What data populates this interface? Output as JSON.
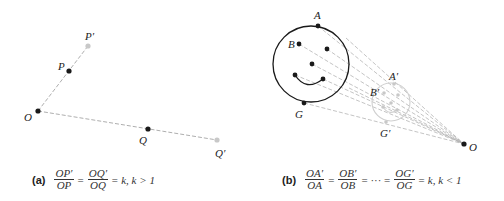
{
  "panel_a": {
    "labels": {
      "O": "O",
      "P": "P",
      "P_prime": "P′",
      "Q": "Q",
      "Q_prime": "Q′"
    },
    "caption": {
      "tag": "(a)",
      "frac1": {
        "num": "OP′",
        "den": "OP"
      },
      "eq1": "=",
      "frac2": {
        "num": "OQ′",
        "den": "OQ"
      },
      "tail": "= k, k > 1"
    }
  },
  "panel_b": {
    "labels": {
      "A": "A",
      "B": "B",
      "G": "G",
      "A_prime": "A′",
      "B_prime": "B′",
      "G_prime": "G′",
      "O": "O"
    },
    "caption": {
      "tag": "(b)",
      "frac1": {
        "num": "OA′",
        "den": "OA"
      },
      "eq1": "=",
      "frac2": {
        "num": "OB′",
        "den": "OB"
      },
      "eq2": "= ··· =",
      "frac3": {
        "num": "OG′",
        "den": "OG"
      },
      "tail": "= k, k < 1"
    }
  },
  "colors": {
    "ink": "#1a1a1a",
    "image_gray": "#c8c8c8",
    "dash": "#999999"
  }
}
